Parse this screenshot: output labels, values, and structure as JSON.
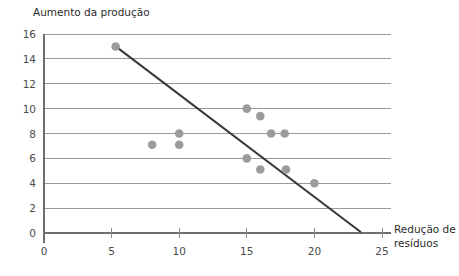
{
  "chart_data": {
    "type": "scatter",
    "title": "",
    "ylabel": "Aumento da produção",
    "xlabel": "Redução de resíduos",
    "xlabel_line1": "Redução de",
    "xlabel_line2": "resíduos",
    "xlim": [
      0,
      25
    ],
    "ylim": [
      0,
      16
    ],
    "xticks": [
      0,
      5,
      10,
      15,
      20,
      25
    ],
    "yticks": [
      0,
      2,
      4,
      6,
      8,
      10,
      12,
      14,
      16
    ],
    "xtick_labels": [
      "0",
      "5",
      "10",
      "15",
      "20",
      "25"
    ],
    "ytick_labels": [
      "0",
      "2",
      "4",
      "6",
      "8",
      "10",
      "12",
      "14",
      "16"
    ],
    "grid": "horizontal",
    "legend": "none",
    "point_color": "#9b9b9b",
    "line_color": "#3a3a3a",
    "grid_color": "#9a9a9a",
    "points": [
      {
        "x": 5.3,
        "y": 15.0
      },
      {
        "x": 8.0,
        "y": 7.1
      },
      {
        "x": 10.0,
        "y": 8.0
      },
      {
        "x": 10.0,
        "y": 7.1
      },
      {
        "x": 15.0,
        "y": 10.0
      },
      {
        "x": 16.0,
        "y": 9.4
      },
      {
        "x": 16.8,
        "y": 8.0
      },
      {
        "x": 17.8,
        "y": 8.0
      },
      {
        "x": 15.0,
        "y": 6.0
      },
      {
        "x": 16.0,
        "y": 5.1
      },
      {
        "x": 17.9,
        "y": 5.1
      },
      {
        "x": 20.0,
        "y": 4.0
      }
    ],
    "trend_line": {
      "x1": 5.3,
      "y1": 15.0,
      "x2": 23.4,
      "y2": 0.1
    },
    "point_radius": 4.3
  }
}
